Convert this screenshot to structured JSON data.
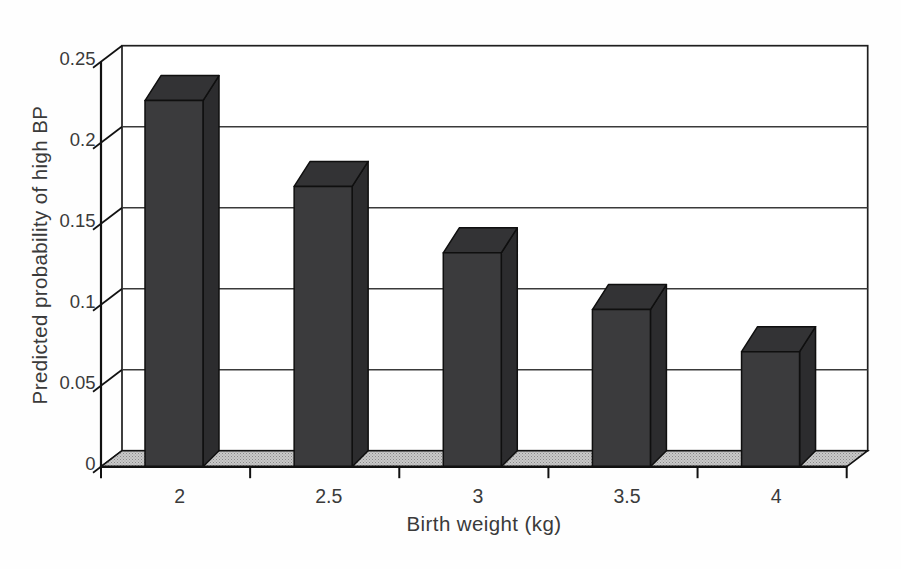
{
  "chart_data": {
    "type": "bar",
    "projection": "3d-column",
    "title": "",
    "xlabel": "Birth weight (kg)",
    "ylabel": "Predicted probability of high BP",
    "categories": [
      "2",
      "2.5",
      "3",
      "3.5",
      "4"
    ],
    "values": [
      0.226,
      0.173,
      0.132,
      0.097,
      0.071
    ],
    "ylim": [
      0,
      0.25
    ],
    "ytick_step": 0.05,
    "ytick_labels": [
      "0",
      "0.05",
      "0.1",
      "0.15",
      "0.2",
      "0.25"
    ],
    "grid": true,
    "legend": "none",
    "colors": {
      "background": "#fefefe",
      "wall_fill": "#ffffff",
      "wall_stroke": "#1f1f1f",
      "gridline": "#3a3a3a",
      "axis": "#111111",
      "bar_front": "#3b3b3d",
      "bar_top": "#333335",
      "bar_side": "#2c2c2e",
      "bar_outline": "#0f0f0f",
      "floor_fill": "#c9c9c9",
      "floor_dot": "#8a8a8a",
      "text": "#3a3a3a"
    }
  }
}
